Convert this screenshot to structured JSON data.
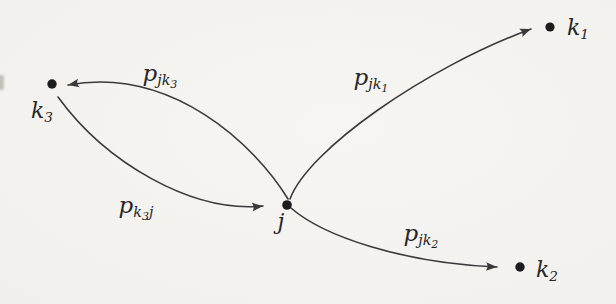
{
  "diagram": {
    "nodes": [
      {
        "id": "j",
        "base": "j",
        "sub": ""
      },
      {
        "id": "k1",
        "base": "k",
        "sub": "1"
      },
      {
        "id": "k2",
        "base": "k",
        "sub": "2"
      },
      {
        "id": "k3",
        "base": "k",
        "sub": "3"
      }
    ],
    "edges": [
      {
        "from": "j",
        "to": "k3",
        "base": "p",
        "sub_pre": "jk",
        "subsub": "3",
        "sub_post": ""
      },
      {
        "from": "k3",
        "to": "j",
        "base": "p",
        "sub_pre": "k",
        "subsub": "3",
        "sub_post": "j"
      },
      {
        "from": "j",
        "to": "k1",
        "base": "p",
        "sub_pre": "jk",
        "subsub": "1",
        "sub_post": ""
      },
      {
        "from": "j",
        "to": "k2",
        "base": "p",
        "sub_pre": "jk",
        "subsub": "2",
        "sub_post": ""
      }
    ],
    "colors": {
      "ink": "#3a3a3a",
      "dot": "#1c1c1c",
      "background": "#f3f1ee"
    }
  }
}
